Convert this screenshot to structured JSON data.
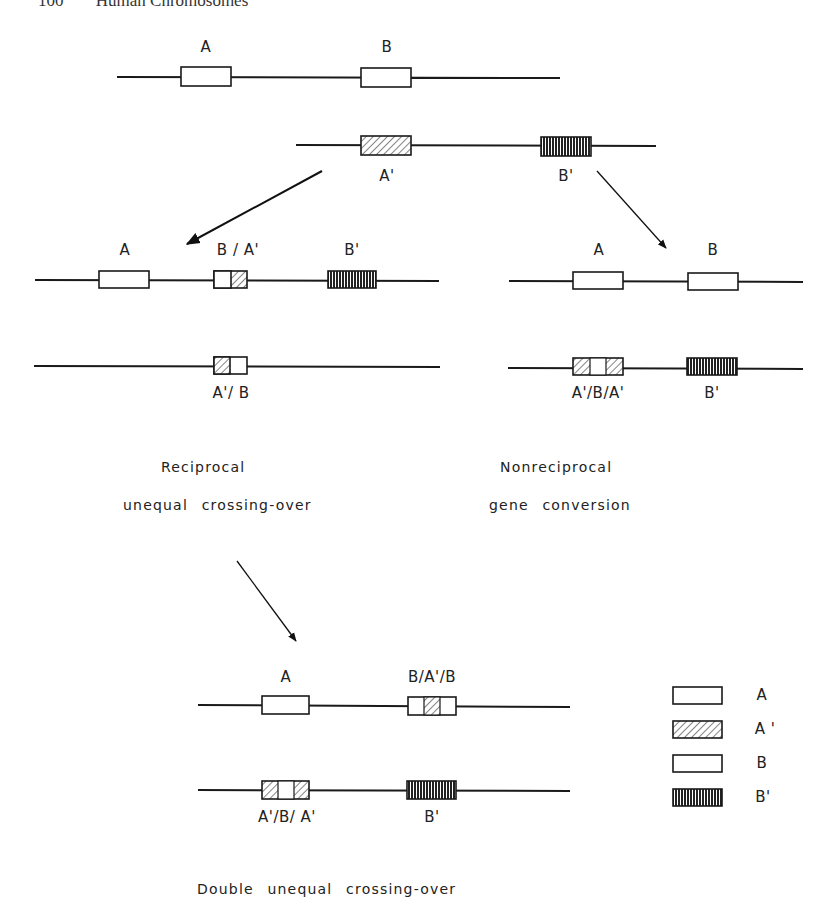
{
  "header": {
    "page_number": "100",
    "running_title": "Human Chromosomes"
  },
  "top": {
    "chromosome1": {
      "genes": [
        {
          "label": "A",
          "type": "A"
        },
        {
          "label": "B",
          "type": "B"
        }
      ]
    },
    "chromosome2": {
      "genes": [
        {
          "label": "A'",
          "type": "A_prime"
        },
        {
          "label": "B'",
          "type": "B_prime"
        }
      ]
    }
  },
  "reciprocal": {
    "row1_labels": [
      "A",
      "B / A'",
      "B'"
    ],
    "row2_labels": [
      "A'/ B"
    ],
    "caption_line1": "Reciprocal",
    "caption_line2": "unequal crossing-over"
  },
  "nonreciprocal": {
    "row1_labels": [
      "A",
      "B"
    ],
    "row2_labels": [
      "A'/B/A'",
      "B'"
    ],
    "caption_line1": "Nonreciprocal",
    "caption_line2": "gene conversion"
  },
  "double": {
    "row1_labels": [
      "A",
      "B/A'/B"
    ],
    "row2_labels": [
      "A'/B/ A'",
      "B'"
    ],
    "caption": "Double unequal crossing-over"
  },
  "legend": {
    "items": [
      {
        "label": "A",
        "pattern": "open"
      },
      {
        "label": "A '",
        "pattern": "diagonal-hatch"
      },
      {
        "label": "B",
        "pattern": "open"
      },
      {
        "label": "B'",
        "pattern": "vertical-hatch"
      }
    ]
  },
  "colors": {
    "line": "#1a1a1a",
    "background": "#ffffff"
  }
}
